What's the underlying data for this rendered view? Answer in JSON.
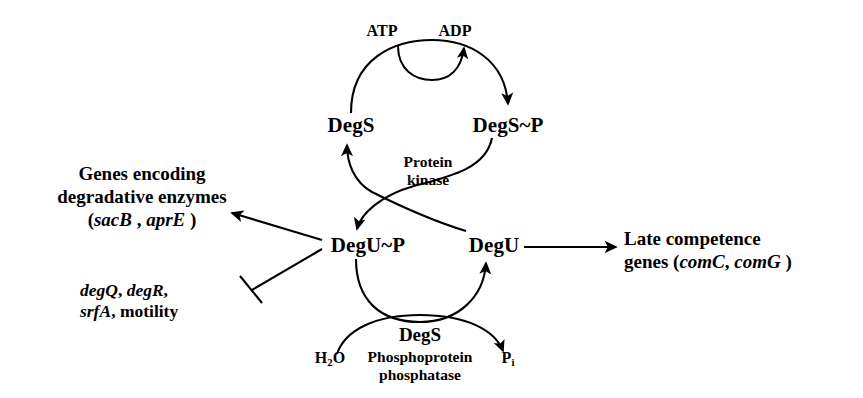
{
  "diagram": {
    "type": "two-component-signal-transduction-pathway",
    "organism_system": "DegS-DegU",
    "nodes": {
      "degS": "DegS",
      "degS_p": "DegS~P",
      "degU_p": "DegU~P",
      "degU": "DegU"
    },
    "cofactors": {
      "atp": "ATP",
      "adp": "ADP",
      "water_pre": "H",
      "water_sub": "2",
      "water_post": "O",
      "phosphate_pre": "P",
      "phosphate_sub": "i"
    },
    "enzymes": {
      "kinase_line1": "Protein",
      "kinase_line2": "kinase",
      "phosphatase_title": "DegS",
      "phosphatase_line1": "Phosphoprotein",
      "phosphatase_line2": "phosphatase"
    },
    "targets": {
      "degradative": {
        "line1": "Genes encoding",
        "line2": "degradative enzymes",
        "paren_open": "(",
        "gene1": "sacB",
        "separator": " , ",
        "gene2": "aprE",
        "paren_close": " )",
        "regulation": "activation"
      },
      "repressed": {
        "gene1": "degQ",
        "sep1": ", ",
        "gene2": "degR",
        "sep2": ",",
        "gene3": "srfA",
        "sep3": ", ",
        "plain": "motility",
        "regulation": "inhibition"
      },
      "competence": {
        "line1": "Late competence",
        "line2_prefix": "genes (",
        "gene1": "comC",
        "separator": ", ",
        "gene2": "comG",
        "paren_close": " )",
        "regulation": "activation"
      }
    },
    "colors": {
      "ink": "#000000",
      "background": "#ffffff"
    }
  }
}
